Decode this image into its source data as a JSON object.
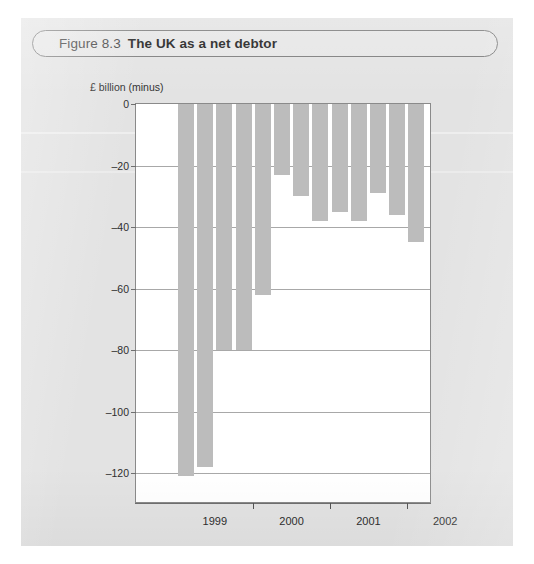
{
  "figure": {
    "number": "Figure 8.3",
    "title": "The UK as a net debtor"
  },
  "chart_data": {
    "type": "bar",
    "title": "The UK as a net debtor",
    "xlabel": "",
    "ylabel": "£ billion (minus)",
    "ylim": [
      -130,
      0
    ],
    "yticks": [
      0,
      -20,
      -40,
      -60,
      -80,
      -100,
      -120
    ],
    "ytick_labels": [
      "0",
      "–20",
      "–40",
      "–60",
      "–80",
      "–100",
      "–120"
    ],
    "grid": true,
    "legend": "none",
    "xtick_labels": [
      "1999",
      "2000",
      "2001",
      "2002"
    ],
    "categories": [
      "1999 Q1",
      "1999 Q2",
      "1999 Q3",
      "1999 Q4",
      "2000 Q1",
      "2000 Q2",
      "2000 Q3",
      "2000 Q4",
      "2001 Q1",
      "2001 Q2",
      "2001 Q3",
      "2001 Q4",
      "2002 Q1"
    ],
    "values": [
      -121,
      -118,
      -80,
      -80,
      -62,
      -23,
      -30,
      -38,
      -35,
      -38,
      -29,
      -36,
      -45
    ],
    "bar_color": "#bcbcbc"
  },
  "colors": {
    "page_background": "#e3e3e3",
    "plot_background": "#ffffff",
    "bar": "#bcbcbc",
    "gridline": "#a8a8a8",
    "axis": "#6f6f6f",
    "text": "#2e2e2e"
  }
}
